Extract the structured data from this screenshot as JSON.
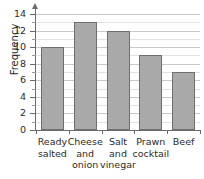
{
  "chart_data": {
    "type": "bar",
    "title": "",
    "xlabel": "",
    "ylabel": "Frequency",
    "categories": [
      "Ready salted",
      "Cheese and onion",
      "Salt and vinegar",
      "Prawn cocktail",
      "Beef"
    ],
    "category_lines": [
      [
        "Ready",
        "salted"
      ],
      [
        "Cheese",
        "and",
        "onion"
      ],
      [
        "Salt",
        "and",
        "vinegar"
      ],
      [
        "Prawn",
        "cocktail"
      ],
      [
        "Beef"
      ]
    ],
    "values": [
      10,
      13,
      12,
      9,
      7
    ],
    "ylim": [
      0,
      14
    ],
    "ytick_labels": [
      "0",
      "2",
      "4",
      "6",
      "8",
      "10",
      "12",
      "14"
    ],
    "ytick_values": [
      0,
      2,
      4,
      6,
      8,
      10,
      12,
      14
    ],
    "minor_tick_step": 1,
    "grid": true,
    "legend": "none",
    "bar_color": "#a9a9a9",
    "bar_border_color": "#6e6e6e",
    "axis_color": "#6b6b6b",
    "grid_color": "#c9c9c9"
  }
}
